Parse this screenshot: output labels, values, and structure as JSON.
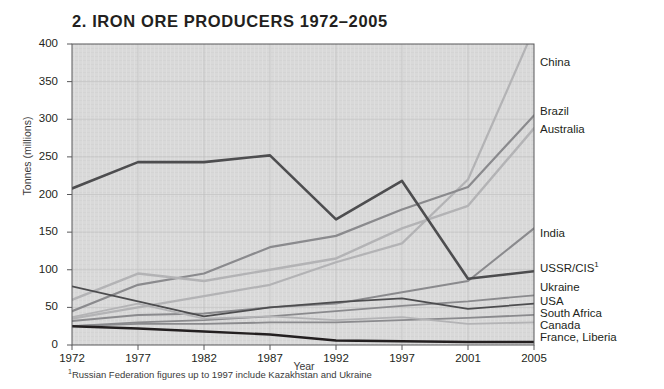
{
  "figure": {
    "title": "2. IRON ORE PRODUCERS 1972–2005",
    "footnote_marker": "1",
    "footnote_text": "Russian Federation figures up to 1997 include Kazakhstan and Ukraine"
  },
  "axes": {
    "ylabel": "Tonnes (millions)",
    "xlabel": "Year",
    "y_ticks": [
      "400",
      "350",
      "300",
      "250",
      "200",
      "150",
      "100",
      "50",
      "0"
    ],
    "x_ticks": [
      "1972",
      "1977",
      "1982",
      "1987",
      "1992",
      "1997",
      "2001",
      "2005"
    ]
  },
  "labels": {
    "china": "China",
    "brazil": "Brazil",
    "australia": "Australia",
    "india": "India",
    "ussr": "USSR/CIS",
    "ussr_sup": "1",
    "ukraine": "Ukraine",
    "usa": "USA",
    "south_africa": "South Africa",
    "canada": "Canada",
    "france_liberia": "France, Liberia"
  },
  "colors": {
    "plot_background": "#d9d9d9",
    "gridline": "#bdbdbd",
    "axis": "#58585a",
    "text": "#231f20",
    "line_dark": "#4d4d4f",
    "line_mid": "#8a8a8d",
    "line_light": "#b3b3b5",
    "line_black": "#231f20"
  },
  "chart_data": {
    "type": "line",
    "title": "2. IRON ORE PRODUCERS 1972–2005",
    "xlabel": "Year",
    "ylabel": "Tonnes (millions)",
    "x": [
      1972,
      1977,
      1982,
      1987,
      1992,
      1997,
      2001,
      2005
    ],
    "xlim": [
      1972,
      2005
    ],
    "ylim": [
      0,
      400
    ],
    "y_ticks": [
      0,
      50,
      100,
      150,
      200,
      250,
      300,
      350,
      400
    ],
    "grid": true,
    "legend_position": "right-of-plot-at-line-end",
    "series": [
      {
        "name": "China",
        "values": [
          35,
          50,
          65,
          80,
          110,
          135,
          220,
          420
        ]
      },
      {
        "name": "Brazil",
        "values": [
          45,
          80,
          95,
          130,
          145,
          180,
          210,
          305
        ]
      },
      {
        "name": "Australia",
        "values": [
          60,
          95,
          85,
          100,
          115,
          155,
          185,
          288
        ]
      },
      {
        "name": "India",
        "values": [
          32,
          40,
          42,
          50,
          55,
          70,
          85,
          155
        ]
      },
      {
        "name": "USSR/CIS",
        "values": [
          208,
          243,
          243,
          252,
          167,
          218,
          88,
          98
        ]
      },
      {
        "name": "Ukraine",
        "values": [
          25,
          30,
          33,
          38,
          45,
          52,
          58,
          66
        ]
      },
      {
        "name": "USA",
        "values": [
          78,
          58,
          38,
          50,
          57,
          62,
          48,
          55
        ]
      },
      {
        "name": "South Africa",
        "values": [
          25,
          28,
          28,
          30,
          30,
          33,
          36,
          40
        ]
      },
      {
        "name": "Canada",
        "values": [
          37,
          55,
          35,
          38,
          33,
          37,
          28,
          30
        ]
      },
      {
        "name": "France, Liberia",
        "values": [
          25,
          22,
          18,
          14,
          6,
          5,
          4,
          4
        ]
      }
    ]
  }
}
